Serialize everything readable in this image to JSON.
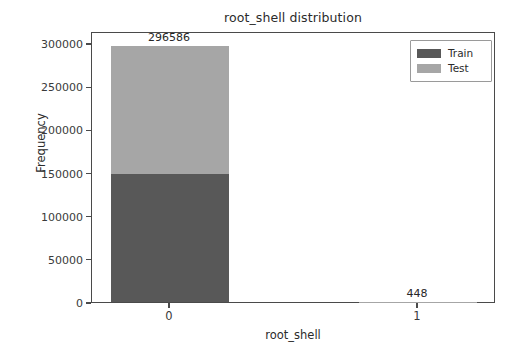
{
  "chart_data": {
    "type": "bar",
    "subtype": "stacked-bar",
    "title": "root_shell distribution",
    "xlabel": "root_shell",
    "ylabel": "Frequency",
    "categories": [
      "0",
      "1"
    ],
    "series": [
      {
        "name": "Train",
        "color": "#585858",
        "values": [
          148293,
          224
        ]
      },
      {
        "name": "Test",
        "color": "#a6a6a6",
        "values": [
          148293,
          224
        ]
      }
    ],
    "totals": [
      296586,
      448
    ],
    "bar_labels": [
      "296586",
      "448"
    ],
    "ylim": [
      0,
      310000
    ],
    "yticks": [
      0,
      50000,
      100000,
      150000,
      200000,
      250000,
      300000
    ],
    "ytick_labels": [
      "0",
      "50000",
      "100000",
      "150000",
      "200000",
      "250000",
      "300000"
    ],
    "xticks": [
      0,
      1
    ],
    "xtick_labels": [
      "0",
      "1"
    ],
    "grid": false,
    "legend_position": "upper right",
    "legend_entries": [
      "Train",
      "Test"
    ],
    "background_color": "#ffffff",
    "axis_color": "#4a4a4a"
  },
  "figure": {
    "title": "root_shell distribution",
    "xlabel": "root_shell",
    "ylabel": "Frequency"
  },
  "legend": {
    "items": [
      {
        "label": "Train"
      },
      {
        "label": "Test"
      }
    ]
  }
}
